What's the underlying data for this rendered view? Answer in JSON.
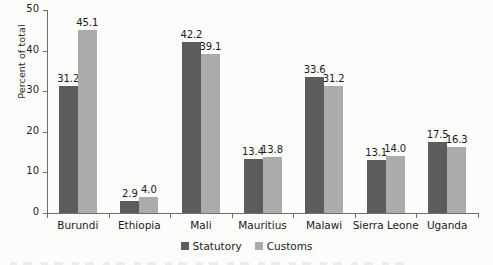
{
  "chart_data": {
    "type": "bar",
    "title": "",
    "subtitle": "",
    "xlabel": "",
    "ylabel": "Percent of total",
    "ylim": [
      0,
      50
    ],
    "yticks": [
      0,
      10,
      20,
      30,
      40,
      50
    ],
    "ytick_labels": [
      "0",
      "10",
      "20",
      "30",
      "40",
      "50"
    ],
    "grid": false,
    "legend_position": "bottom-center",
    "categories": [
      "Burundi",
      "Ethiopia",
      "Mali",
      "Mauritius",
      "Malawi",
      "Sierra Leone",
      "Uganda"
    ],
    "series": [
      {
        "name": "Statutory",
        "color": "#5c5c5c",
        "values": [
          31.2,
          2.9,
          42.2,
          13.4,
          33.6,
          13.1,
          17.5
        ],
        "labels": [
          "31.2",
          "2.9",
          "42.2",
          "13.4",
          "33.6",
          "13.1",
          "17.5"
        ]
      },
      {
        "name": "Customs",
        "color": "#ababab",
        "values": [
          45.1,
          4.0,
          39.1,
          13.8,
          31.2,
          14.0,
          16.3
        ],
        "labels": [
          "45.1",
          "4.0",
          "39.1",
          "13.8",
          "31.2",
          "14.0",
          "16.3"
        ]
      }
    ]
  },
  "legend": {
    "items": [
      {
        "label": "Statutory",
        "color": "#5c5c5c",
        "swatch_name": "statutory-swatch"
      },
      {
        "label": "Customs",
        "color": "#ababab",
        "swatch_name": "customs-swatch"
      }
    ]
  },
  "axis": {
    "y_label": "Percent of total"
  }
}
